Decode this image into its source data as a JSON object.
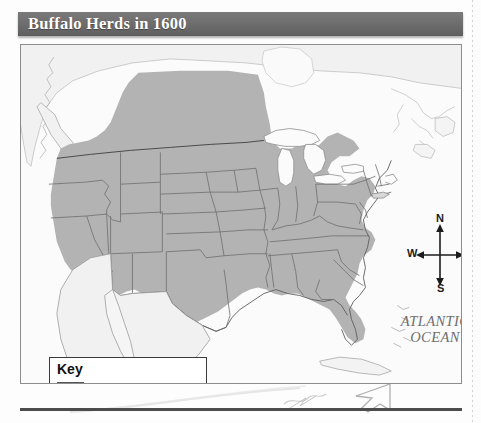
{
  "page": {
    "title": "Buffalo Herds in 1600"
  },
  "map": {
    "ocean_label_line1": "ATLANTIC",
    "ocean_label_line2": "OCEAN",
    "shaded_region_color": "#b3b3b3",
    "land_color": "#f2f2f2",
    "water_color": "#fbfbfb",
    "border_color": "#5a5a5a",
    "frame_color": "#8d8d8d"
  },
  "compass": {
    "north": "N",
    "south": "S",
    "east": "E",
    "west": "W"
  },
  "legend": {
    "title": "Key",
    "entries": [
      {
        "label": "Buffalo herds, 1600",
        "swatch_color": "#b3b3b3"
      }
    ]
  },
  "banner": {
    "background_color": "#6a6a6a",
    "text_color": "#ffffff"
  },
  "icons": {
    "compass_north_arrow": "arrow-up-icon",
    "compass_south_arrow": "arrow-down-icon",
    "compass_east_arrow": "arrow-right-icon",
    "compass_west_arrow": "arrow-left-icon",
    "cursor": "mouse-cursor-icon"
  }
}
